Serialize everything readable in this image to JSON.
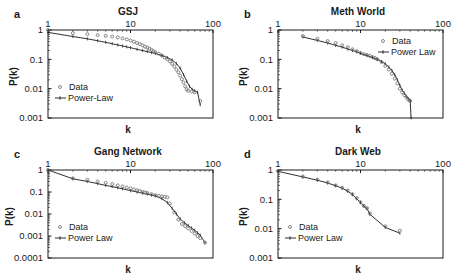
{
  "figure": {
    "background": "#ffffff",
    "ink_color": "#1a1a1a",
    "data_marker_color": "#6b6b6b"
  },
  "panels": [
    {
      "letter": "a",
      "title": "GSJ",
      "xlabel": "k",
      "ylabel": "P(k)",
      "legend": {
        "data": "Data",
        "fit": "Power-Law",
        "position": "bottom-left"
      },
      "xticks": [
        "1",
        "10",
        "100"
      ],
      "yticks": [
        "1",
        "0.1",
        "0.01",
        "0.001"
      ]
    },
    {
      "letter": "b",
      "title": "Meth World",
      "xlabel": "k",
      "ylabel": "P(k)",
      "legend": {
        "data": "Data",
        "fit": "Power Law",
        "position": "top-right"
      },
      "xticks": [
        "1",
        "10",
        "100"
      ],
      "yticks": [
        "1",
        "0.1",
        "0.01",
        "0.001"
      ]
    },
    {
      "letter": "c",
      "title": "Gang Network",
      "xlabel": "k",
      "ylabel": "P(k)",
      "legend": {
        "data": "Data",
        "fit": "Power Law",
        "position": "bottom-left"
      },
      "xticks": [
        "1",
        "10",
        "100"
      ],
      "yticks": [
        "1",
        "0.1",
        "0.01",
        "0.001",
        "0.0001"
      ]
    },
    {
      "letter": "d",
      "title": "Dark Web",
      "xlabel": "k",
      "ylabel": "P(k)",
      "legend": {
        "data": "Data",
        "fit": "Power Law",
        "position": "bottom-left"
      },
      "xticks": [
        "1",
        "10",
        "100"
      ],
      "yticks": [
        "1",
        "0.1",
        "0.01",
        "0.001"
      ]
    }
  ],
  "chart_data": [
    {
      "type": "scatter",
      "panel": "a",
      "title": "GSJ",
      "xlabel": "k",
      "ylabel": "P(k)",
      "xscale": "log",
      "yscale": "log",
      "xlim": [
        1,
        100
      ],
      "ylim": [
        0.001,
        1
      ],
      "grid": false,
      "legend_position": "bottom-left",
      "series": [
        {
          "name": "Data",
          "marker": "open-circle",
          "x": [
            1,
            2,
            3,
            4,
            5,
            6,
            7,
            8,
            9,
            10,
            11,
            12,
            13,
            14,
            15,
            16,
            17,
            18,
            19,
            20,
            22,
            24,
            26,
            28,
            30,
            32,
            34,
            36,
            38,
            40,
            42,
            44,
            46,
            48,
            50,
            55,
            60,
            70
          ],
          "y": [
            1.0,
            0.78,
            0.72,
            0.67,
            0.63,
            0.6,
            0.56,
            0.52,
            0.48,
            0.44,
            0.4,
            0.36,
            0.33,
            0.3,
            0.27,
            0.25,
            0.23,
            0.21,
            0.19,
            0.175,
            0.155,
            0.135,
            0.115,
            0.1,
            0.085,
            0.07,
            0.057,
            0.045,
            0.036,
            0.028,
            0.021,
            0.016,
            0.012,
            0.0095,
            0.0085,
            0.008,
            0.0075,
            0.0038
          ]
        },
        {
          "name": "Power-Law",
          "marker": "line-with-ticks",
          "x": [
            1,
            2,
            3,
            4,
            5,
            6,
            7,
            8,
            9,
            10,
            12,
            14,
            16,
            18,
            20,
            24,
            28,
            32,
            36,
            40,
            44,
            48,
            52,
            56,
            60,
            65,
            70
          ],
          "y": [
            0.83,
            0.6,
            0.5,
            0.43,
            0.38,
            0.34,
            0.31,
            0.285,
            0.265,
            0.25,
            0.22,
            0.2,
            0.183,
            0.17,
            0.158,
            0.135,
            0.115,
            0.095,
            0.072,
            0.05,
            0.03,
            0.018,
            0.012,
            0.0095,
            0.0085,
            0.0075,
            0.0028
          ]
        }
      ]
    },
    {
      "type": "scatter",
      "panel": "b",
      "title": "Meth World",
      "xlabel": "k",
      "ylabel": "P(k)",
      "xscale": "log",
      "yscale": "log",
      "xlim": [
        1,
        100
      ],
      "ylim": [
        0.001,
        1
      ],
      "grid": false,
      "legend_position": "top-right",
      "series": [
        {
          "name": "Data",
          "marker": "open-circle",
          "x": [
            2,
            3,
            4,
            5,
            6,
            7,
            8,
            9,
            10,
            11,
            12,
            13,
            14,
            15,
            16,
            18,
            20,
            22,
            24,
            26,
            28,
            30,
            32,
            34,
            36,
            38,
            40
          ],
          "y": [
            0.62,
            0.5,
            0.42,
            0.36,
            0.3,
            0.26,
            0.22,
            0.19,
            0.165,
            0.15,
            0.14,
            0.13,
            0.12,
            0.11,
            0.1,
            0.08,
            0.06,
            0.045,
            0.032,
            0.022,
            0.015,
            0.01,
            0.0075,
            0.006,
            0.005,
            0.0042,
            0.0038
          ]
        },
        {
          "name": "Power Law",
          "marker": "line-with-ticks",
          "x": [
            2,
            3,
            4,
            5,
            6,
            7,
            8,
            9,
            10,
            12,
            14,
            16,
            18,
            20,
            22,
            24,
            26,
            28,
            30,
            32,
            34,
            36,
            38,
            40,
            41
          ],
          "y": [
            0.58,
            0.44,
            0.36,
            0.3,
            0.26,
            0.225,
            0.2,
            0.18,
            0.16,
            0.135,
            0.115,
            0.1,
            0.085,
            0.07,
            0.055,
            0.042,
            0.03,
            0.02,
            0.013,
            0.009,
            0.007,
            0.0055,
            0.0045,
            0.004,
            0.001
          ]
        }
      ]
    },
    {
      "type": "scatter",
      "panel": "c",
      "title": "Gang Network",
      "xlabel": "k",
      "ylabel": "P(k)",
      "xscale": "log",
      "yscale": "log",
      "xlim": [
        1,
        100
      ],
      "ylim": [
        0.0001,
        1
      ],
      "grid": false,
      "legend_position": "bottom-left",
      "series": [
        {
          "name": "Data",
          "marker": "open-circle",
          "x": [
            1,
            2,
            3,
            4,
            5,
            6,
            7,
            8,
            9,
            10,
            11,
            12,
            13,
            14,
            15,
            16,
            18,
            20,
            22,
            24,
            26,
            28,
            30,
            34,
            38,
            42,
            46,
            50,
            55,
            60,
            65,
            70,
            80
          ],
          "y": [
            1.0,
            0.42,
            0.36,
            0.3,
            0.26,
            0.23,
            0.2,
            0.18,
            0.16,
            0.145,
            0.13,
            0.12,
            0.11,
            0.1,
            0.095,
            0.09,
            0.08,
            0.072,
            0.067,
            0.063,
            0.06,
            0.057,
            0.03,
            0.012,
            0.0055,
            0.0035,
            0.0028,
            0.0022,
            0.0017,
            0.0013,
            0.001,
            0.0008,
            0.0005
          ]
        },
        {
          "name": "Power Law",
          "marker": "line-with-ticks",
          "x": [
            1,
            2,
            3,
            4,
            5,
            6,
            7,
            8,
            10,
            12,
            14,
            16,
            18,
            20,
            24,
            28,
            32,
            36,
            40,
            45,
            50,
            55,
            60,
            65,
            70,
            80
          ],
          "y": [
            1.0,
            0.4,
            0.3,
            0.24,
            0.2,
            0.175,
            0.155,
            0.14,
            0.115,
            0.1,
            0.088,
            0.08,
            0.072,
            0.066,
            0.05,
            0.033,
            0.018,
            0.01,
            0.006,
            0.004,
            0.003,
            0.0023,
            0.0018,
            0.0014,
            0.0011,
            0.0005
          ]
        }
      ]
    },
    {
      "type": "scatter",
      "panel": "d",
      "title": "Dark Web",
      "xlabel": "k",
      "ylabel": "P(k)",
      "xscale": "log",
      "yscale": "log",
      "xlim": [
        1,
        100
      ],
      "ylim": [
        0.001,
        1
      ],
      "grid": false,
      "legend_position": "bottom-left",
      "series": [
        {
          "name": "Data",
          "marker": "open-circle",
          "x": [
            1,
            2,
            3,
            4,
            5,
            6,
            7,
            8,
            9,
            10,
            11,
            12,
            13,
            20,
            30
          ],
          "y": [
            0.93,
            0.6,
            0.47,
            0.38,
            0.3,
            0.25,
            0.2,
            0.15,
            0.11,
            0.08,
            0.06,
            0.05,
            0.033,
            0.012,
            0.0085
          ]
        },
        {
          "name": "Power Law",
          "marker": "line-with-ticks",
          "x": [
            1,
            2,
            3,
            4,
            5,
            6,
            7,
            8,
            9,
            10,
            11,
            12,
            13,
            20,
            30
          ],
          "y": [
            0.9,
            0.58,
            0.45,
            0.36,
            0.29,
            0.24,
            0.19,
            0.145,
            0.105,
            0.078,
            0.058,
            0.048,
            0.031,
            0.011,
            0.007
          ]
        }
      ]
    }
  ]
}
